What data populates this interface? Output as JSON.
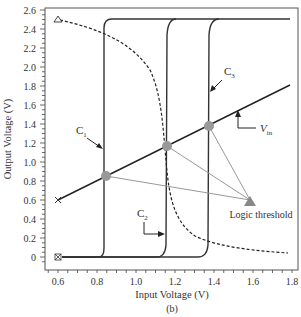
{
  "chart_data": {
    "type": "line",
    "title": "",
    "caption": "(b)",
    "xlabel": "Input Voltage (V)",
    "ylabel": "Output Voltage (V)",
    "xlim": [
      0.6,
      1.8
    ],
    "ylim": [
      0,
      2.6
    ],
    "x_ticks": [
      "0.6",
      "0.8",
      "1.0",
      "1.2",
      "1.4",
      "1.6",
      "1.8"
    ],
    "y_ticks": [
      "0",
      "0.2",
      "0.4",
      "0.6",
      "0.8",
      "1.0",
      "1.2",
      "1.4",
      "1.6",
      "1.8",
      "2.0",
      "2.2",
      "2.4",
      "2.6"
    ],
    "grid": false,
    "series": [
      {
        "name": "C1",
        "style": "solid",
        "x": [
          0.62,
          0.79,
          0.83,
          0.835,
          0.84,
          0.86,
          1.8
        ],
        "y": [
          0,
          0,
          0.1,
          1.0,
          2.4,
          2.5,
          2.5
        ]
      },
      {
        "name": "C2",
        "style": "solid",
        "x": [
          0.62,
          1.1,
          1.15,
          1.16,
          1.17,
          1.2,
          1.8
        ],
        "y": [
          0,
          0,
          0.1,
          1.2,
          2.4,
          2.5,
          2.5
        ]
      },
      {
        "name": "C3",
        "style": "solid",
        "x": [
          0.62,
          1.31,
          1.36,
          1.37,
          1.38,
          1.42,
          1.8
        ],
        "y": [
          0,
          0,
          0.1,
          1.4,
          2.4,
          2.5,
          2.5
        ]
      },
      {
        "name": "Vin",
        "style": "solid",
        "x": [
          0.6,
          1.8
        ],
        "y": [
          0.6,
          1.8
        ]
      },
      {
        "name": "dashed",
        "style": "dashed",
        "x": [
          0.6,
          0.85,
          1.06,
          1.11,
          1.14,
          1.17,
          1.26,
          1.46,
          1.76
        ],
        "y": [
          2.5,
          2.35,
          2.02,
          1.6,
          1.02,
          0.5,
          0.23,
          0.1,
          0.04
        ]
      }
    ],
    "annotations": [
      {
        "text": "C1",
        "target": "C1 curve"
      },
      {
        "text": "C2",
        "target": "C2 curve"
      },
      {
        "text": "C3",
        "target": "C3 curve"
      },
      {
        "text": "Vin",
        "target": "Vin line"
      },
      {
        "text": "Logic threshold",
        "points": [
          [
            0.84,
            0.84
          ],
          [
            1.16,
            1.16
          ],
          [
            1.37,
            1.37
          ]
        ]
      }
    ],
    "markers": [
      {
        "shape": "triangle-open",
        "x": 0.6,
        "y": 2.5
      },
      {
        "shape": "x",
        "x": 0.6,
        "y": 0.6
      },
      {
        "shape": "boxed-x",
        "x": 0.6,
        "y": 0
      }
    ]
  },
  "labels": {
    "c1": "C",
    "c1_sub": "1",
    "c2": "C",
    "c2_sub": "2",
    "c3": "C",
    "c3_sub": "3",
    "vin": "V",
    "vin_sub": "in",
    "logic_threshold": "Logic threshold",
    "xlabel": "Input Voltage (V)",
    "ylabel": "Output Voltage (V)",
    "caption": "(b)"
  }
}
